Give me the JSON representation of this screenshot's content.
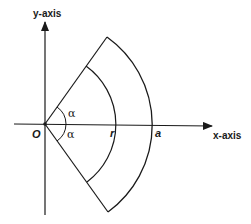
{
  "diagram": {
    "type": "polar-sector",
    "labels": {
      "y_axis": "y-axis",
      "x_axis": "x-axis",
      "origin": "O",
      "inner_radius": "r",
      "outer_radius": "a",
      "angle_upper": "α",
      "angle_lower": "α"
    },
    "geometry": {
      "origin": [
        45,
        124
      ],
      "outer_radius_px": 110,
      "inner_radius_px": 72,
      "half_angle_deg": 55
    },
    "colors": {
      "stroke": "#1a1a1a",
      "background": "#ffffff"
    }
  }
}
